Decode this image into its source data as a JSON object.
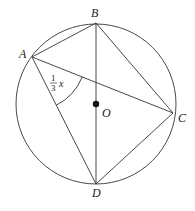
{
  "diagram": {
    "type": "circle-inscribed-quadrilateral",
    "colors": {
      "stroke": "#333333",
      "background": "#ffffff",
      "center_dot": "#111111"
    },
    "circle": {
      "center_label": "O",
      "cx": 96,
      "cy": 104,
      "r": 80
    },
    "points": [
      {
        "id": "A",
        "label": "A",
        "x": 32,
        "y": 57
      },
      {
        "id": "B",
        "label": "B",
        "x": 96,
        "y": 23
      },
      {
        "id": "C",
        "label": "C",
        "x": 173,
        "y": 113
      },
      {
        "id": "D",
        "label": "D",
        "x": 96,
        "y": 184
      }
    ],
    "segments": [
      [
        "A",
        "B"
      ],
      [
        "B",
        "C"
      ],
      [
        "C",
        "D"
      ],
      [
        "D",
        "A"
      ],
      [
        "A",
        "C"
      ],
      [
        "B",
        "D"
      ]
    ],
    "angle_marker": {
      "vertex": "A",
      "between": [
        "D",
        "C"
      ],
      "label_numerator": "1",
      "label_denominator": "3",
      "label_variable": "x"
    }
  }
}
